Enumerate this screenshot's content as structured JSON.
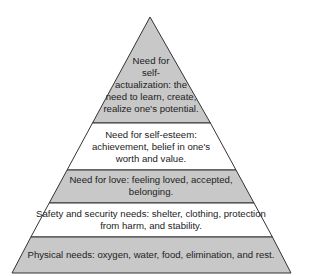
{
  "diagram": {
    "type": "pyramid",
    "colors": {
      "shaded": "#c8c8c8",
      "plain": "#ffffff",
      "stroke": "#333333"
    },
    "tiers": [
      {
        "label": "Need for self-actualization: the need to learn, create, realize one's potential.",
        "lines": [
          "Need for",
          "self-",
          "actualization: the",
          "need to learn, create,",
          "realize one's potential."
        ],
        "fill": "shaded"
      },
      {
        "label": "Need for self-esteem: achievement, belief in one's worth and value.",
        "lines": [
          "Need for self-esteem:",
          "achievement, belief in one's",
          "worth and value."
        ],
        "fill": "plain"
      },
      {
        "label": "Need for love: feeling loved, accepted, belonging.",
        "lines": [
          "Need for love: feeling loved, accepted,",
          "belonging."
        ],
        "fill": "shaded"
      },
      {
        "label": "Safety and security needs: shelter, clothing, protection from harm, and stability.",
        "lines": [
          "Safety and security needs: shelter, clothing, protection",
          "from harm, and stability."
        ],
        "fill": "plain"
      },
      {
        "label": "Physical needs: oxygen, water, food, elimination, and rest.",
        "lines": [
          "Physical needs: oxygen, water, food, elimination, and rest."
        ],
        "fill": "shaded"
      }
    ]
  }
}
